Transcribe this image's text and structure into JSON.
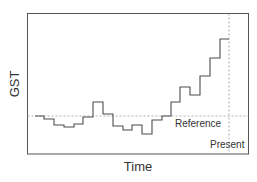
{
  "chart_data": {
    "type": "line",
    "style": "step",
    "title": "",
    "xlabel": "Time",
    "ylabel": "GST",
    "x_ticks": [],
    "y_ticks": [],
    "grid": false,
    "legend": null,
    "annotations": [
      {
        "text": "Reference",
        "kind": "horizontal-dashed-line",
        "y": 0
      },
      {
        "text": "Present",
        "kind": "vertical-dashed-line",
        "x": 20
      }
    ],
    "series": [
      {
        "name": "GST",
        "x": [
          0,
          1,
          2,
          3,
          4,
          5,
          6,
          7,
          8,
          9,
          10,
          11,
          12,
          13,
          14,
          15,
          16,
          17,
          18,
          19
        ],
        "values": [
          0,
          -1,
          -3,
          -4,
          -3,
          -0.5,
          5,
          0.5,
          -3.5,
          -5,
          -3.5,
          -6.5,
          -1.5,
          0,
          5,
          10,
          7,
          14,
          20,
          27
        ]
      }
    ],
    "reference_value": 0,
    "present_x": 20
  },
  "labels": {
    "y_axis": "GST",
    "x_axis": "Time",
    "reference": "Reference",
    "present": "Present"
  },
  "colors": {
    "line": "#4d4d4d",
    "frame": "#555555",
    "dashed": "#999999",
    "text": "#333333"
  },
  "plot_px": {
    "left": 27,
    "top": 13,
    "right": 248,
    "bottom": 154,
    "reference_y": 116,
    "present_x": 229,
    "step_x": [
      35,
      44,
      54,
      64,
      74,
      83,
      93,
      103,
      113,
      123,
      132,
      142,
      152,
      162,
      171,
      180,
      190,
      200,
      210,
      220,
      229
    ],
    "step_y": [
      116,
      119,
      125,
      127,
      124,
      117,
      102,
      114,
      126,
      130,
      125,
      134,
      120,
      116,
      102,
      87,
      95,
      76,
      58,
      39
    ]
  }
}
